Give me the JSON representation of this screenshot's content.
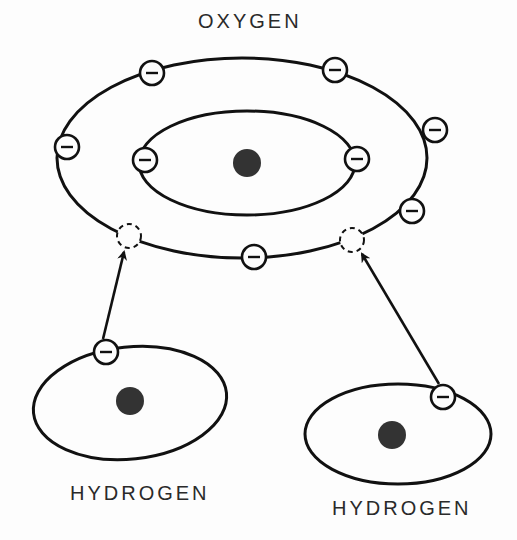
{
  "diagram": {
    "colors": {
      "line": "#111111",
      "nucleus": "#333333",
      "text": "#2a2a2a",
      "background": "#fdfdfd"
    },
    "oxygen": {
      "label": "OXYGEN",
      "nucleus": {
        "cx": 247,
        "cy": 163,
        "r": 14
      },
      "outer_shell": {
        "cx": 242,
        "cy": 158,
        "rx": 185,
        "ry": 100
      },
      "inner_shell": {
        "cx": 247,
        "cy": 163,
        "rx": 108,
        "ry": 52
      },
      "inner_electrons": [
        {
          "cx": 145,
          "cy": 160,
          "symbol": "−"
        },
        {
          "cx": 357,
          "cy": 159,
          "symbol": "−"
        }
      ],
      "outer_electrons": [
        {
          "cx": 67,
          "cy": 147,
          "symbol": "−"
        },
        {
          "cx": 152,
          "cy": 73,
          "symbol": "−"
        },
        {
          "cx": 335,
          "cy": 70,
          "symbol": "−"
        },
        {
          "cx": 435,
          "cy": 130,
          "symbol": "−"
        },
        {
          "cx": 412,
          "cy": 211,
          "symbol": "−"
        },
        {
          "cx": 254,
          "cy": 257,
          "symbol": "−"
        }
      ],
      "vacancies": [
        {
          "cx": 129,
          "cy": 236
        },
        {
          "cx": 352,
          "cy": 240
        }
      ]
    },
    "hydrogen_left": {
      "label": "HYDROGEN",
      "orbit": {
        "cx": 130,
        "cy": 403,
        "rx": 97,
        "ry": 56,
        "rotate": -6
      },
      "nucleus": {
        "cx": 130,
        "cy": 401,
        "r": 14
      },
      "electron": {
        "cx": 106,
        "cy": 352,
        "symbol": "−"
      },
      "arrow": {
        "x1": 103,
        "y1": 339,
        "x2": 124,
        "y2": 252
      }
    },
    "hydrogen_right": {
      "label": "HYDROGEN",
      "orbit": {
        "cx": 398,
        "cy": 434,
        "rx": 93,
        "ry": 50,
        "rotate": 0
      },
      "nucleus": {
        "cx": 392,
        "cy": 435,
        "r": 14
      },
      "electron": {
        "cx": 443,
        "cy": 397,
        "symbol": "−"
      },
      "arrow": {
        "x1": 439,
        "y1": 384,
        "x2": 362,
        "y2": 254
      }
    },
    "electron_radius": 12,
    "vacancy_radius": 12
  }
}
